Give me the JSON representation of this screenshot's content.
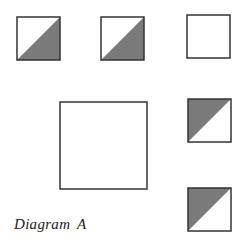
{
  "caption": "Diagram A",
  "colors": {
    "stroke": "#333333",
    "fill": "#7a7a7a",
    "background": "#ffffff"
  },
  "shapes": [
    {
      "id": "square-1",
      "x": 17,
      "y": 17,
      "size": 43,
      "shading": "lower-right"
    },
    {
      "id": "square-2",
      "x": 101,
      "y": 17,
      "size": 43,
      "shading": "lower-right"
    },
    {
      "id": "square-3",
      "x": 187,
      "y": 15,
      "size": 43,
      "shading": "none"
    },
    {
      "id": "large-square",
      "x": 60,
      "y": 102,
      "size": 87,
      "shading": "none"
    },
    {
      "id": "square-4",
      "x": 188,
      "y": 99,
      "size": 43,
      "shading": "upper-left"
    },
    {
      "id": "square-5",
      "x": 188,
      "y": 188,
      "size": 43,
      "shading": "upper-left"
    }
  ]
}
